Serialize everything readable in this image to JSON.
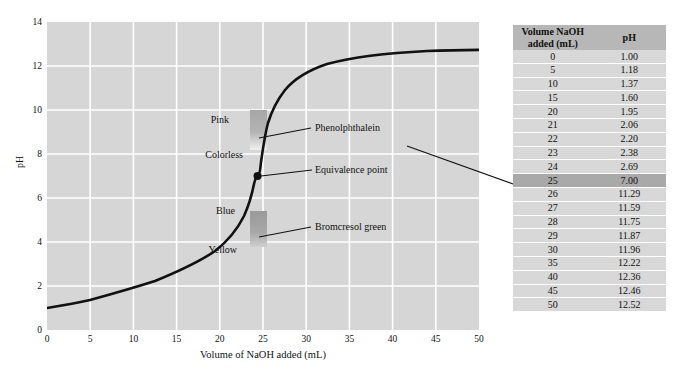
{
  "chart_data": {
    "type": "line",
    "title": "",
    "xlabel": "Volume of NaOH added (mL)",
    "ylabel": "pH",
    "xlim": [
      0,
      50
    ],
    "ylim": [
      0,
      14
    ],
    "xticks": [
      0,
      5,
      10,
      15,
      20,
      25,
      30,
      35,
      40,
      45,
      50
    ],
    "yticks": [
      0,
      2,
      4,
      6,
      8,
      10,
      12,
      14
    ],
    "grid": true,
    "legend": "none",
    "series": [
      {
        "name": "Titration curve (strong acid with NaOH)",
        "x": [
          0,
          5,
          10,
          15,
          20,
          21,
          22,
          23,
          24,
          25,
          26,
          27,
          28,
          29,
          30,
          35,
          40,
          45,
          50
        ],
        "values": [
          1.0,
          1.18,
          1.37,
          1.6,
          1.95,
          2.06,
          2.2,
          2.38,
          2.69,
          7.0,
          11.29,
          11.59,
          11.75,
          11.87,
          11.96,
          12.22,
          12.36,
          12.46,
          12.52
        ]
      }
    ],
    "annotations": [
      {
        "name": "equivalence-point",
        "label": "Equivalence point",
        "x": 25,
        "y": 7.0
      },
      {
        "name": "phenolphthalein",
        "label": "Phenolphthalein",
        "range_low": 8.2,
        "range_high": 10.0,
        "below_label": "Colorless",
        "above_label": "Pink"
      },
      {
        "name": "bromcresol-green",
        "label": "Bromcresol green",
        "range_low": 3.8,
        "range_high": 5.4,
        "below_label": "Yellow",
        "above_label": "Blue"
      }
    ]
  },
  "axes": {
    "y_title": "pH",
    "x_title": "Volume of NaOH added (mL)",
    "y_ticks": [
      "14",
      "12",
      "10",
      "8",
      "6",
      "4",
      "2",
      "0"
    ],
    "x_ticks": [
      "0",
      "5",
      "10",
      "15",
      "20",
      "25",
      "30",
      "35",
      "40",
      "45",
      "50"
    ]
  },
  "plot_labels": {
    "pink": "Pink",
    "colorless": "Colorless",
    "blue": "Blue",
    "yellow": "Yellow",
    "phenolphthalein": "Phenolphthalein",
    "bromcresol_green": "Bromcresol green",
    "equivalence_point": "Equivalence point"
  },
  "table": {
    "headers": {
      "volume": "Volume NaOH added (mL)",
      "volume_line1": "Volume NaOH",
      "volume_line2": "added (mL)",
      "ph": "pH"
    },
    "rows": [
      {
        "volume": "0",
        "ph": "1.00",
        "highlight": false
      },
      {
        "volume": "5",
        "ph": "1.18",
        "highlight": false
      },
      {
        "volume": "10",
        "ph": "1.37",
        "highlight": false
      },
      {
        "volume": "15",
        "ph": "1.60",
        "highlight": false
      },
      {
        "volume": "20",
        "ph": "1.95",
        "highlight": false
      },
      {
        "volume": "21",
        "ph": "2.06",
        "highlight": false
      },
      {
        "volume": "22",
        "ph": "2.20",
        "highlight": false
      },
      {
        "volume": "23",
        "ph": "2.38",
        "highlight": false
      },
      {
        "volume": "24",
        "ph": "2.69",
        "highlight": false
      },
      {
        "volume": "25",
        "ph": "7.00",
        "highlight": true
      },
      {
        "volume": "26",
        "ph": "11.29",
        "highlight": false
      },
      {
        "volume": "27",
        "ph": "11.59",
        "highlight": false
      },
      {
        "volume": "28",
        "ph": "11.75",
        "highlight": false
      },
      {
        "volume": "29",
        "ph": "11.87",
        "highlight": false
      },
      {
        "volume": "30",
        "ph": "11.96",
        "highlight": false
      },
      {
        "volume": "35",
        "ph": "12.22",
        "highlight": false
      },
      {
        "volume": "40",
        "ph": "12.36",
        "highlight": false
      },
      {
        "volume": "45",
        "ph": "12.46",
        "highlight": false
      },
      {
        "volume": "50",
        "ph": "12.52",
        "highlight": false
      }
    ]
  },
  "colors": {
    "plot_background": "#d6d6d6",
    "gridline": "#ffffff",
    "curve": "#000000",
    "table_header_bg": "#b7b7b7",
    "table_row_bg": "#d8d8d8",
    "table_highlight_bg": "#a9a9a9",
    "indicator_band": "#a8a8a8",
    "page_background": "#ffffff"
  }
}
